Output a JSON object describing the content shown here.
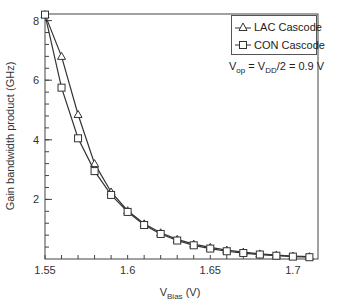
{
  "chart_data": {
    "type": "line",
    "title": "",
    "xlabel": "V_Bias (V)",
    "ylabel": "Gain bandwidth product (GHz)",
    "xlim": [
      1.55,
      1.7152
    ],
    "ylim": [
      0,
      8.2
    ],
    "xticks": [
      1.55,
      1.6,
      1.65,
      1.7
    ],
    "xtick_labels": [
      "1.55",
      "1.6",
      "1.65",
      "1.7"
    ],
    "yticks": [
      2,
      4,
      6,
      8
    ],
    "ytick_labels": [
      "2",
      "4",
      "6",
      "8"
    ],
    "grid": false,
    "legend_position": "upper right",
    "x": [
      1.55,
      1.56,
      1.57,
      1.58,
      1.59,
      1.6,
      1.61,
      1.62,
      1.63,
      1.64,
      1.65,
      1.66,
      1.67,
      1.68,
      1.69,
      1.7,
      1.71
    ],
    "series": [
      {
        "name": "LAC Cascode",
        "marker": "triangle",
        "values": [
          8.2,
          6.8,
          4.85,
          3.2,
          2.25,
          1.62,
          1.18,
          0.88,
          0.66,
          0.5,
          0.39,
          0.3,
          0.23,
          0.17,
          0.13,
          0.1,
          0.08
        ]
      },
      {
        "name": "CON Cascode",
        "marker": "square",
        "values": [
          8.2,
          5.75,
          4.05,
          2.95,
          2.15,
          1.58,
          1.14,
          0.84,
          0.62,
          0.46,
          0.35,
          0.26,
          0.2,
          0.15,
          0.11,
          0.08,
          0.06
        ]
      }
    ],
    "annotations": [
      "V_op = V_DD/2 = 0.9 V"
    ]
  },
  "legend": {
    "items": [
      {
        "label": "LAC Cascode",
        "marker": "triangle-icon"
      },
      {
        "label": "CON Cascode",
        "marker": "square-icon"
      }
    ]
  },
  "annotation": {
    "v1": "V",
    "s1": "op",
    "mid": " = V",
    "s2": "DD",
    "tail": "/2 = 0.9 V"
  },
  "axes": {
    "xlabel_main": "V",
    "xlabel_sub": "Bias",
    "xlabel_unit": " (V)",
    "ylabel": "Gain bandwidth product (GHz)"
  }
}
